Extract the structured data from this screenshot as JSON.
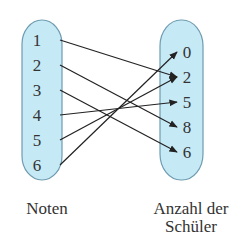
{
  "diagram": {
    "clipped_heading": "",
    "left_set": {
      "label": "Noten",
      "elements": [
        "1",
        "2",
        "3",
        "4",
        "5",
        "6"
      ]
    },
    "right_set": {
      "label_line1": "Anzahl der",
      "label_line2": "Schüler",
      "elements": [
        "0",
        "2",
        "5",
        "8",
        "6"
      ]
    },
    "mappings": [
      {
        "from": "1",
        "to": "2"
      },
      {
        "from": "2",
        "to": "8"
      },
      {
        "from": "3",
        "to": "6"
      },
      {
        "from": "4",
        "to": "5"
      },
      {
        "from": "5",
        "to": "2"
      },
      {
        "from": "6",
        "to": "0"
      }
    ],
    "colors": {
      "set_fill": "#c6e9f6",
      "set_stroke": "#6f9cb0",
      "arrow": "#222222"
    }
  }
}
